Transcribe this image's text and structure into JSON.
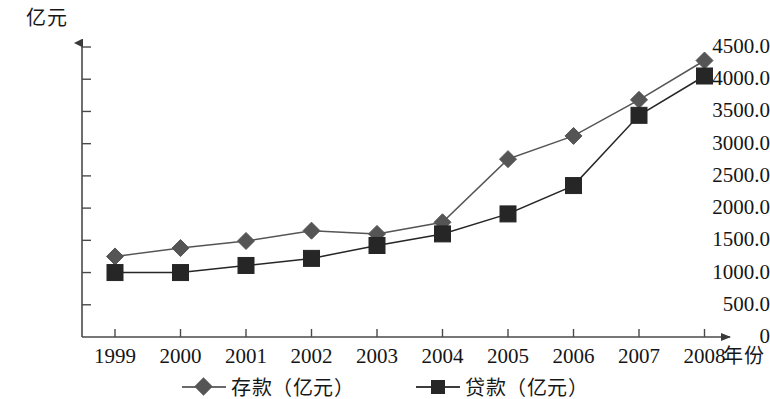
{
  "chart_data": {
    "type": "line",
    "title": "",
    "xlabel": "年份",
    "ylabel": "亿元",
    "categories": [
      "1999",
      "2000",
      "2001",
      "2002",
      "2003",
      "2004",
      "2005",
      "2006",
      "2007",
      "2008"
    ],
    "series": [
      {
        "name": "存款（亿元）",
        "marker": "diamond",
        "color": "#555555",
        "values": [
          1250,
          1380,
          1490,
          1650,
          1600,
          1780,
          2760,
          3120,
          3680,
          4290
        ]
      },
      {
        "name": "贷款（亿元）",
        "marker": "square",
        "color": "#262626",
        "values": [
          1000,
          1000,
          1110,
          1220,
          1420,
          1600,
          1910,
          2350,
          3440,
          4050
        ]
      }
    ],
    "ylim": [
      0,
      4500
    ],
    "y_ticks": [
      "0",
      "500.0",
      "1000.0",
      "1500.0",
      "2000.0",
      "2500.0",
      "3000.0",
      "3500.0",
      "4000.0",
      "4500.0"
    ],
    "y_tick_values": [
      0,
      500,
      1000,
      1500,
      2000,
      2500,
      3000,
      3500,
      4000,
      4500
    ],
    "grid": false,
    "legend_position": "bottom"
  },
  "legend": {
    "items": [
      {
        "label": "存款（亿元）"
      },
      {
        "label": "贷款（亿元）"
      }
    ]
  }
}
